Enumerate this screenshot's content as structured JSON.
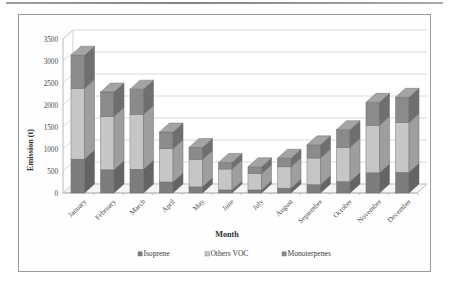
{
  "figure": {
    "frame_border_color": "#9a9a9a",
    "background": "#ffffff"
  },
  "chart_data": {
    "type": "bar",
    "stacked": true,
    "title": "",
    "xlabel": "Month",
    "ylabel": "Emission (t)",
    "ylim": [
      0,
      3500
    ],
    "yticks": [
      0,
      500,
      1000,
      1500,
      2000,
      2500,
      3000,
      3500
    ],
    "ytick_labels": [
      "0",
      "500",
      "1000",
      "1500",
      "2000",
      "2500",
      "3000",
      "3500"
    ],
    "grid": true,
    "grid_axis": "y",
    "legend_position": "bottom",
    "categories": [
      "January",
      "February",
      "March",
      "April",
      "May",
      "June",
      "July",
      "August",
      "September",
      "October",
      "November",
      "December"
    ],
    "series": [
      {
        "name": "Isoprene",
        "color": "#7d7d7d",
        "values": [
          770,
          530,
          540,
          250,
          140,
          70,
          70,
          110,
          190,
          260,
          460,
          470
        ]
      },
      {
        "name": "Others VOC",
        "color": "#c6c6c6",
        "values": [
          1610,
          1215,
          1245,
          755,
          620,
          475,
          370,
          485,
          605,
          780,
          1080,
          1135
        ]
      },
      {
        "name": "Monoterpenes",
        "color": "#8b8b8b",
        "values": [
          750,
          550,
          575,
          380,
          275,
          150,
          155,
          195,
          300,
          400,
          520,
          570
        ]
      }
    ],
    "totals": [
      3130,
      2295,
      2360,
      1385,
      1035,
      695,
      595,
      790,
      1095,
      1440,
      2060,
      2175
    ]
  },
  "axes": {
    "x_title": "Month",
    "y_title": "Emission (t)"
  },
  "legend": {
    "items": [
      {
        "label": "Isoprene",
        "color": "#7d7d7d",
        "marker": "square-marker"
      },
      {
        "label": "Others VOC",
        "color": "#c6c6c6",
        "marker": "square-marker"
      },
      {
        "label": "Monoterpenes",
        "color": "#8b8b8b",
        "marker": "square-marker"
      }
    ]
  }
}
